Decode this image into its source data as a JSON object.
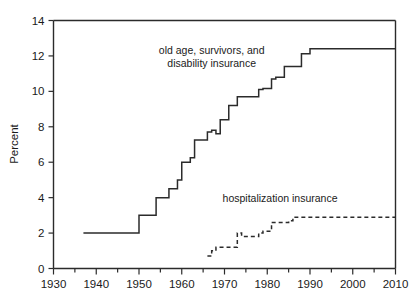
{
  "chart_data": {
    "type": "line",
    "title": "",
    "subtitle": "",
    "xlabel": "",
    "ylabel": "Percent",
    "xlim": [
      1930,
      2010
    ],
    "ylim": [
      0,
      14
    ],
    "xticks": [
      1930,
      1940,
      1950,
      1960,
      1970,
      1980,
      1990,
      2000,
      2010
    ],
    "xtick_labels": [
      "1930",
      "1940",
      "1950",
      "1960",
      "1970",
      "1980",
      "1990",
      "2000",
      "2010"
    ],
    "xminor_ticks": [
      1935,
      1945,
      1955,
      1965,
      1975,
      1985,
      1995,
      2005
    ],
    "yticks": [
      0,
      2,
      4,
      6,
      8,
      10,
      12,
      14
    ],
    "ytick_labels": [
      "0",
      "2",
      "4",
      "6",
      "8",
      "10",
      "12",
      "14"
    ],
    "grid": false,
    "legend_position": "inline-annotations",
    "axis_color": "#2b2b2b",
    "series": [
      {
        "name": "old age, survivors, and disability insurance",
        "style": "solid",
        "color": "#2b2b2b",
        "label_lines": [
          "old age, survivors, and",
          "disability insurance"
        ],
        "label_x": 1967,
        "label_y": 12.1,
        "points": [
          [
            1937,
            2.0
          ],
          [
            1950,
            2.0
          ],
          [
            1950,
            3.0
          ],
          [
            1954,
            3.0
          ],
          [
            1954,
            4.0
          ],
          [
            1957,
            4.0
          ],
          [
            1957,
            4.5
          ],
          [
            1959,
            4.5
          ],
          [
            1959,
            5.0
          ],
          [
            1960,
            5.0
          ],
          [
            1960,
            6.0
          ],
          [
            1962,
            6.0
          ],
          [
            1962,
            6.25
          ],
          [
            1963,
            6.25
          ],
          [
            1963,
            7.25
          ],
          [
            1966,
            7.25
          ],
          [
            1966,
            7.7
          ],
          [
            1967,
            7.7
          ],
          [
            1967,
            7.8
          ],
          [
            1968,
            7.8
          ],
          [
            1968,
            7.6
          ],
          [
            1969,
            7.6
          ],
          [
            1969,
            8.4
          ],
          [
            1971,
            8.4
          ],
          [
            1971,
            9.2
          ],
          [
            1973,
            9.2
          ],
          [
            1973,
            9.7
          ],
          [
            1978,
            9.7
          ],
          [
            1978,
            10.1
          ],
          [
            1979,
            10.1
          ],
          [
            1979,
            10.16
          ],
          [
            1981,
            10.16
          ],
          [
            1981,
            10.7
          ],
          [
            1982,
            10.7
          ],
          [
            1982,
            10.8
          ],
          [
            1984,
            10.8
          ],
          [
            1984,
            11.4
          ],
          [
            1988,
            11.4
          ],
          [
            1988,
            12.12
          ],
          [
            1990,
            12.12
          ],
          [
            1990,
            12.4
          ],
          [
            2010,
            12.4
          ]
        ]
      },
      {
        "name": "hospitalization insurance",
        "style": "dashed",
        "color": "#2b2b2b",
        "label_lines": [
          "hospitalization insurance"
        ],
        "label_x": 1983,
        "label_y": 3.75,
        "points": [
          [
            1966,
            0.7
          ],
          [
            1967,
            0.7
          ],
          [
            1967,
            1.0
          ],
          [
            1968,
            1.0
          ],
          [
            1968,
            1.2
          ],
          [
            1973,
            1.2
          ],
          [
            1973,
            2.0
          ],
          [
            1974,
            2.0
          ],
          [
            1974,
            1.8
          ],
          [
            1978,
            1.8
          ],
          [
            1978,
            2.0
          ],
          [
            1979,
            2.0
          ],
          [
            1979,
            2.1
          ],
          [
            1981,
            2.1
          ],
          [
            1981,
            2.6
          ],
          [
            1982,
            2.6
          ],
          [
            1982,
            2.6
          ],
          [
            1985,
            2.6
          ],
          [
            1985,
            2.7
          ],
          [
            1986,
            2.7
          ],
          [
            1986,
            2.9
          ],
          [
            2010,
            2.9
          ]
        ]
      }
    ]
  }
}
